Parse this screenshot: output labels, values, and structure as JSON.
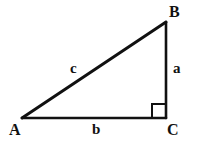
{
  "figure": {
    "kind": "right-triangle-diagram",
    "background_color": "#ffffff",
    "stroke_color": "#111111",
    "canvas": {
      "width": 202,
      "height": 146
    }
  },
  "vertices": [
    {
      "id": "A",
      "label": "A",
      "x": 22,
      "y": 118
    },
    {
      "id": "B",
      "label": "B",
      "x": 166,
      "y": 22
    },
    {
      "id": "C",
      "label": "C",
      "x": 166,
      "y": 118
    }
  ],
  "sides": [
    {
      "id": "a",
      "label": "a",
      "from": "B",
      "to": "C",
      "role": "opposite-leg-vertical"
    },
    {
      "id": "b",
      "label": "b",
      "from": "A",
      "to": "C",
      "role": "adjacent-leg-horizontal"
    },
    {
      "id": "c",
      "label": "c",
      "from": "A",
      "to": "B",
      "role": "hypotenuse"
    }
  ],
  "right_angle": {
    "at_vertex": "C",
    "marker": "square",
    "size": 14
  }
}
